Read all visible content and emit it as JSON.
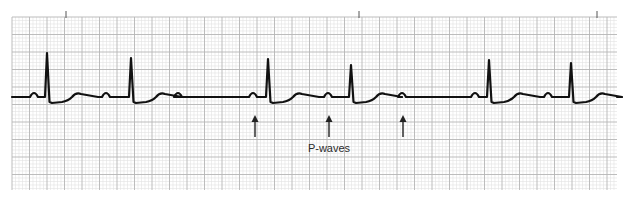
{
  "figure": {
    "type": "ecg-rhythm-strip",
    "annotation_label": "P-waves",
    "colors": {
      "paper": "#ffffff",
      "grid_minor": "#e2e2e2",
      "grid_major": "#b5b5b5",
      "trace": "#111111",
      "annotation": "#222222"
    }
  },
  "strip": {
    "x0": 12,
    "x1": 617,
    "y0": 17,
    "y1": 190,
    "minor_step": 3.5,
    "major_step": 17.5,
    "baseline_y": 97,
    "time_ticks_x": [
      66,
      359,
      597
    ]
  },
  "beats": [
    {
      "qrs_x": 48,
      "peak_y": 53,
      "p_before_x": 34
    },
    {
      "qrs_x": 132,
      "peak_y": 58,
      "p_before_x": 106
    },
    {
      "qrs_x": 269,
      "peak_y": 59,
      "p_before_x": 253
    },
    {
      "qrs_x": 352,
      "peak_y": 65,
      "p_before_x": 328
    },
    {
      "qrs_x": 490,
      "peak_y": 60,
      "p_before_x": 475
    },
    {
      "qrs_x": 572,
      "peak_y": 63,
      "p_before_x": 548
    }
  ],
  "extra_p_waves_x": [
    178,
    402
  ],
  "arrows": [
    {
      "x": 255,
      "y_top": 115,
      "y_bottom": 137
    },
    {
      "x": 329,
      "y_top": 115,
      "y_bottom": 137
    },
    {
      "x": 403,
      "y_top": 115,
      "y_bottom": 137
    }
  ],
  "label_pos": {
    "x": 329,
    "y": 152
  }
}
